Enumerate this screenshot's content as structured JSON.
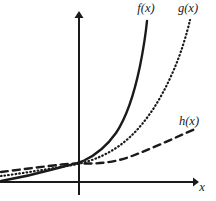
{
  "figure": {
    "background_color": "#ffffff",
    "ink_color": "#1a1a1a",
    "width": 216,
    "height": 201
  },
  "axes": {
    "x_axis_label": "x",
    "y_axis_label": "",
    "x_axis_y_px": 182,
    "y_axis_x_px": 79,
    "x_arrow": "arrow-right",
    "y_arrow": "arrow-up",
    "x_label_pos": {
      "x": 202,
      "y": 191
    },
    "origin": {
      "x": 79,
      "y": 182
    }
  },
  "labels": {
    "f": "f(x)",
    "g": "g(x)",
    "h": "h(x)",
    "x": "x",
    "f_pos": {
      "x": 146,
      "y": 12
    },
    "g_pos": {
      "x": 188,
      "y": 12
    },
    "h_pos": {
      "x": 189,
      "y": 125
    }
  },
  "chart_data": {
    "type": "line",
    "title": "",
    "subtitle": "",
    "xlabel": "x",
    "ylabel": "",
    "grid": false,
    "legend_position": "curve-end-labels",
    "axis_style": "arrows-both-ends",
    "xlim": [
      -1.65,
      2.45
    ],
    "ylim": [
      0,
      3.55
    ],
    "x_origin_value": 0,
    "annotations": [
      {
        "text": "f(x)",
        "target": "series-f",
        "placement": "above-curve-end"
      },
      {
        "text": "g(x)",
        "target": "series-g",
        "placement": "above-curve-end"
      },
      {
        "text": "h(x)",
        "target": "series-h",
        "placement": "above-curve-end"
      },
      {
        "text": "x",
        "target": "x-axis",
        "placement": "axis-end"
      }
    ],
    "series": [
      {
        "name": "f(x)",
        "style": "solid",
        "stroke_width": 2.4,
        "color": "#1a1a1a",
        "growth_rank": 1,
        "path_px": "M 1,181 C 18,178 40,173 58,168 C 68,165.5 76,163.8 84,160.5 C 96,155 106,147 116,133 C 126,118 134,95 140,66 C 144,46 146,31 147,21"
      },
      {
        "name": "g(x)",
        "style": "dotted",
        "stroke_width": 2.2,
        "color": "#1a1a1a",
        "growth_rank": 2,
        "path_px": "M 1,176 C 18,174 42,170 60,167 C 70,165.5 76,164.5 84,162.5 C 100,158 116,150 130,137 C 146,122 160,101 172,74 C 181,54 187,33 190,20"
      },
      {
        "name": "h(x)",
        "style": "dashed",
        "stroke_width": 2.4,
        "color": "#1a1a1a",
        "growth_rank": 3,
        "path_px": "M 1,172 C 20,169.5 44,166.5 62,164.5 C 70,163.6 76,163.2 84,163.5 C 100,164 116,162 132,156 C 152,148.5 172,139 195,129"
      }
    ]
  }
}
